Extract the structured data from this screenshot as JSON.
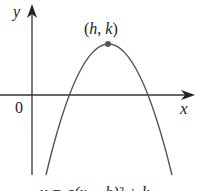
{
  "diagram": {
    "type": "parabola-graph",
    "axes": {
      "x_label": "x",
      "y_label": "y",
      "origin_label": "0"
    },
    "vertex_label": "(h, k)",
    "vertex_label_parts": {
      "open": "(",
      "h": "h",
      "sep": ", ",
      "k": "k",
      "close": ")"
    },
    "curve": "downward-opening parabola with vertex above x-axis, crossing x-axis at two points",
    "caption": "y = a(x − h)² + k",
    "caption_note": "caption partially cut off at bottom edge",
    "colors": {
      "line": "#333333",
      "curve": "#555555",
      "vertex_dot": "#555555"
    }
  }
}
